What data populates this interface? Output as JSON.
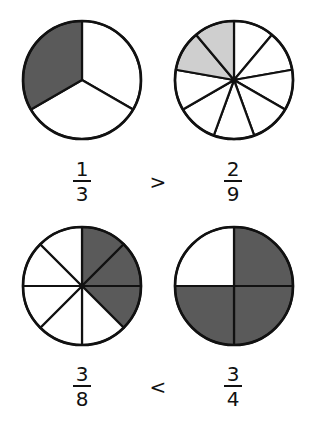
{
  "colors": {
    "dark_fill": "#5a5a5a",
    "light_fill": "#cfcfcf",
    "empty_fill": "#ffffff",
    "stroke": "#111111"
  },
  "comparisons": [
    {
      "left": {
        "numerator": "1",
        "denominator": "3",
        "parts": 3,
        "shaded": 1,
        "shade": "dark",
        "shaded_side": "ccw"
      },
      "operator": ">",
      "right": {
        "numerator": "2",
        "denominator": "9",
        "parts": 9,
        "shaded": 2,
        "shade": "light",
        "shaded_side": "ccw"
      }
    },
    {
      "left": {
        "numerator": "3",
        "denominator": "8",
        "parts": 8,
        "shaded": 3,
        "shade": "dark",
        "shaded_side": "cw"
      },
      "operator": "<",
      "right": {
        "numerator": "3",
        "denominator": "4",
        "parts": 4,
        "shaded": 3,
        "shade": "dark",
        "shaded_side": "cw"
      }
    }
  ]
}
